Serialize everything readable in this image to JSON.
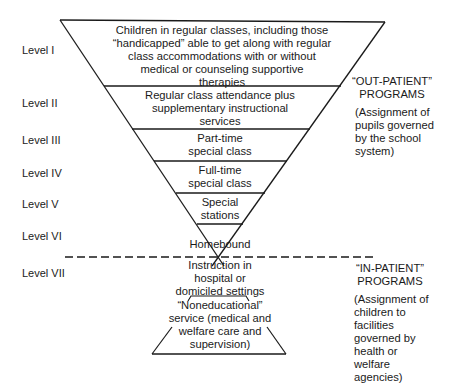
{
  "levels": [
    {
      "label": "Level I"
    },
    {
      "label": "Level II"
    },
    {
      "label": "Level III"
    },
    {
      "label": "Level IV"
    },
    {
      "label": "Level V"
    },
    {
      "label": "Level VI"
    },
    {
      "label": "Level VII"
    }
  ],
  "tiers": [
    {
      "lines": [
        "Children in regular classes, including those",
        "“handicapped” able to get along with regular",
        "class accommodations with or without",
        "medical or counseling supportive",
        "therapies"
      ]
    },
    {
      "lines": [
        "Regular class attendance plus",
        "supplementary instructional",
        "services"
      ]
    },
    {
      "lines": [
        "Part-time",
        "special class"
      ]
    },
    {
      "lines": [
        "Full-time",
        "special class"
      ]
    },
    {
      "lines": [
        "Special",
        "stations"
      ]
    },
    {
      "lines": [
        "Homebound"
      ]
    },
    {
      "lines": [
        "Instruction in",
        "hospital or",
        "domiciled settings"
      ]
    },
    {
      "lines": [
        "“Noneducational”",
        "service (medical and",
        "welfare care and",
        "supervision)"
      ]
    }
  ],
  "out_patient": {
    "title": [
      "“OUT-PATIENT”",
      "PROGRAMS"
    ],
    "desc": [
      "(Assignment of",
      "pupils governed",
      "by the school",
      "system)"
    ]
  },
  "in_patient": {
    "title": [
      "“IN-PATIENT”",
      "PROGRAMS"
    ],
    "desc": [
      "(Assignment of",
      "children to",
      "facilities",
      "governed by",
      "health or",
      "welfare",
      "agencies)"
    ]
  },
  "colors": {
    "ink": "#1a1a1a",
    "background": "#ffffff"
  }
}
